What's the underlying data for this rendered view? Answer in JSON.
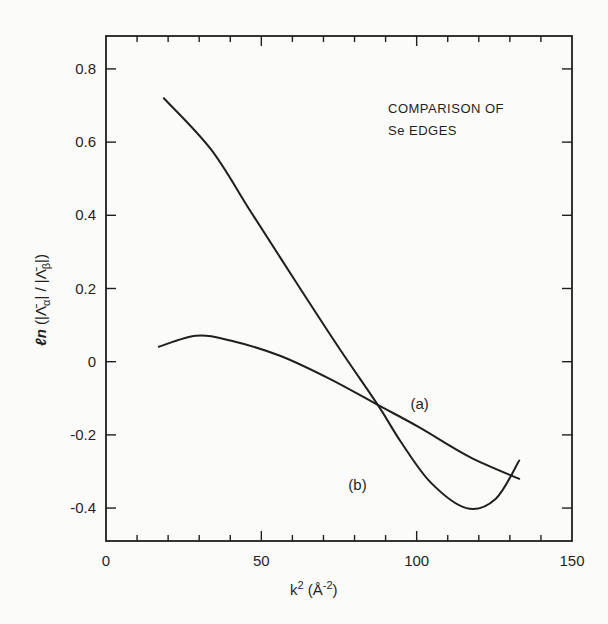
{
  "chart_data": {
    "type": "line",
    "title": "",
    "annotation": [
      "COMPARISON OF",
      "Se EDGES"
    ],
    "xlabel": "k² (Å⁻²)",
    "ylabel": "ℓn (|Λ̄α| / |Λ̄β|)",
    "xlim": [
      0,
      150
    ],
    "ylim": [
      -0.49,
      0.89
    ],
    "xticks": [
      0,
      50,
      100,
      150
    ],
    "xtick_labels": [
      "0",
      "50",
      "100",
      "150"
    ],
    "xminor_step": 10,
    "yticks": [
      0.8,
      0.6,
      0.4,
      0.2,
      0,
      -0.2,
      -0.4
    ],
    "ytick_labels": [
      "0.8",
      "0.6",
      "0.4",
      "0.2",
      "0",
      "-0.2",
      "-0.4"
    ],
    "grid": false,
    "legend": "inline labels",
    "series": [
      {
        "name": "(a)",
        "x": [
          17,
          29,
          40,
          56,
          72,
          87.5,
          101,
          117,
          133
        ],
        "y": [
          0.041,
          0.071,
          0.058,
          0.016,
          -0.047,
          -0.118,
          -0.18,
          -0.26,
          -0.32
        ]
      },
      {
        "name": "(b)",
        "x": [
          18.6,
          33.8,
          46.6,
          61,
          75.6,
          87.5,
          95,
          104.5,
          116,
          125.4,
          133
        ],
        "y": [
          0.72,
          0.58,
          0.41,
          0.22,
          0.03,
          -0.118,
          -0.22,
          -0.33,
          -0.4,
          -0.375,
          -0.27
        ]
      }
    ],
    "series_label_positions": [
      {
        "name": "(a)",
        "x": 98,
        "y": -0.13
      },
      {
        "name": "(b)",
        "x": 78,
        "y": -0.35
      }
    ]
  },
  "colors": {
    "ink": "#1f1f1f",
    "background": "#fbfbfa"
  }
}
